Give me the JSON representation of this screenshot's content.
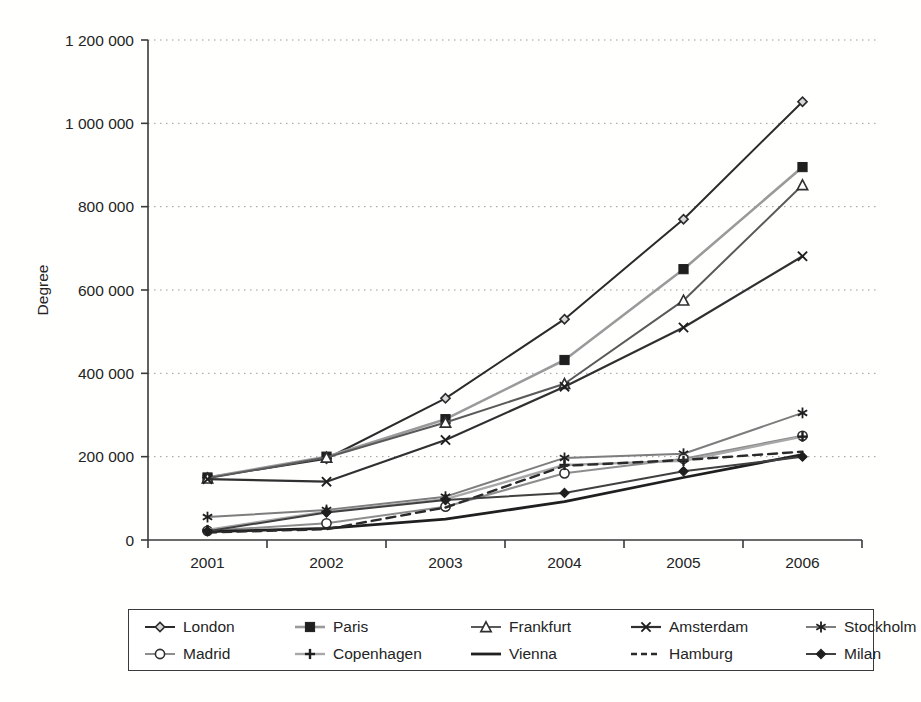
{
  "chart_data": {
    "type": "line",
    "title": "",
    "xlabel": "",
    "ylabel": "Degree",
    "categories": [
      "2001",
      "2002",
      "2003",
      "2004",
      "2005",
      "2006"
    ],
    "ylim": [
      0,
      1200000
    ],
    "ytick_values": [
      0,
      200000,
      400000,
      600000,
      800000,
      1000000,
      1200000
    ],
    "ytick_labels": [
      "0",
      "200 000",
      "400 000",
      "600 000",
      "800 000",
      "1 000 000",
      "1 200 000"
    ],
    "grid": "horizontal-dotted",
    "legend_position": "bottom",
    "series": [
      {
        "name": "London",
        "marker": "diamond-open",
        "color": "#2b2b2b",
        "dash": "solid",
        "width": 2.0,
        "values": [
          150000,
          195000,
          340000,
          530000,
          770000,
          1052000
        ]
      },
      {
        "name": "Paris",
        "marker": "square-filled",
        "color": "#9a9a9a",
        "dash": "solid",
        "width": 2.6,
        "values": [
          150000,
          200000,
          290000,
          432000,
          650000,
          895000
        ]
      },
      {
        "name": "Frankfurt",
        "marker": "triangle-open",
        "color": "#5a5a5a",
        "dash": "solid",
        "width": 2.0,
        "values": [
          148000,
          198000,
          282000,
          375000,
          575000,
          852000
        ]
      },
      {
        "name": "Amsterdam",
        "marker": "x-cross",
        "color": "#303030",
        "dash": "solid",
        "width": 2.2,
        "values": [
          146000,
          140000,
          240000,
          368000,
          510000,
          681000
        ]
      },
      {
        "name": "Stockholm",
        "marker": "asterisk",
        "color": "#7d7d7d",
        "dash": "solid",
        "width": 2.0,
        "values": [
          55000,
          72000,
          104000,
          197000,
          207000,
          305000
        ]
      },
      {
        "name": "Madrid",
        "marker": "circle-open",
        "color": "#8d8d8d",
        "dash": "solid",
        "width": 2.0,
        "values": [
          22000,
          40000,
          80000,
          160000,
          195000,
          250000
        ]
      },
      {
        "name": "Copenhagen",
        "marker": "plus",
        "color": "#a8a8a8",
        "dash": "solid",
        "width": 2.4,
        "values": [
          24000,
          68000,
          98000,
          180000,
          190000,
          248000
        ]
      },
      {
        "name": "Vienna",
        "marker": "none",
        "color": "#1f1f1f",
        "dash": "solid",
        "width": 2.8,
        "values": [
          20000,
          28000,
          50000,
          92000,
          150000,
          205000
        ]
      },
      {
        "name": "Hamburg",
        "marker": "none",
        "color": "#2a2a2a",
        "dash": "dashed",
        "width": 2.4,
        "values": [
          18000,
          26000,
          78000,
          178000,
          192000,
          212000
        ]
      },
      {
        "name": "Milan",
        "marker": "diamond-filled",
        "color": "#404040",
        "dash": "solid",
        "width": 2.0,
        "values": [
          21000,
          66000,
          96000,
          113000,
          165000,
          200000
        ]
      }
    ]
  },
  "legend": {
    "items": [
      {
        "label": "London"
      },
      {
        "label": "Paris"
      },
      {
        "label": "Frankfurt"
      },
      {
        "label": "Amsterdam"
      },
      {
        "label": "Stockholm"
      },
      {
        "label": "Madrid"
      },
      {
        "label": "Copenhagen"
      },
      {
        "label": "Vienna"
      },
      {
        "label": "Hamburg"
      },
      {
        "label": "Milan"
      }
    ]
  },
  "axes": {
    "y_title": "Degree"
  }
}
